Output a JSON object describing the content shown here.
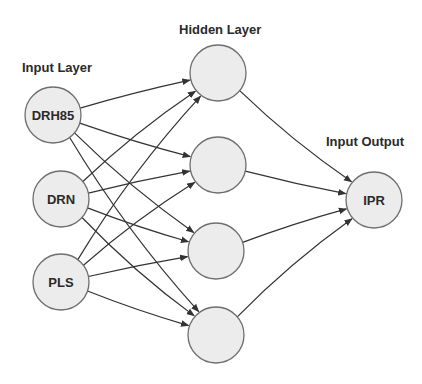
{
  "titles": {
    "input": "Input Layer",
    "hidden": "Hidden Layer",
    "output": "Input Output"
  },
  "nodes": {
    "input": [
      {
        "id": "in1",
        "label": "DRH85",
        "cx": 53,
        "cy": 115
      },
      {
        "id": "in2",
        "label": "DRN",
        "cx": 61,
        "cy": 199
      },
      {
        "id": "in3",
        "label": "PLS",
        "cx": 61,
        "cy": 282
      }
    ],
    "hidden": [
      {
        "id": "h1",
        "label": "",
        "cx": 218,
        "cy": 73
      },
      {
        "id": "h2",
        "label": "",
        "cx": 218,
        "cy": 165
      },
      {
        "id": "h3",
        "label": "",
        "cx": 216,
        "cy": 251
      },
      {
        "id": "h4",
        "label": "",
        "cx": 216,
        "cy": 335
      }
    ],
    "output": [
      {
        "id": "out1",
        "label": "IPR",
        "cx": 374,
        "cy": 200
      }
    ]
  },
  "style": {
    "node_fill": "#ececec",
    "node_stroke": "#6e6e6e",
    "edge_color": "#333333",
    "text_color": "#2a2a2a"
  },
  "edges": "fully-connected: each input node → each hidden node; each hidden node → output node"
}
